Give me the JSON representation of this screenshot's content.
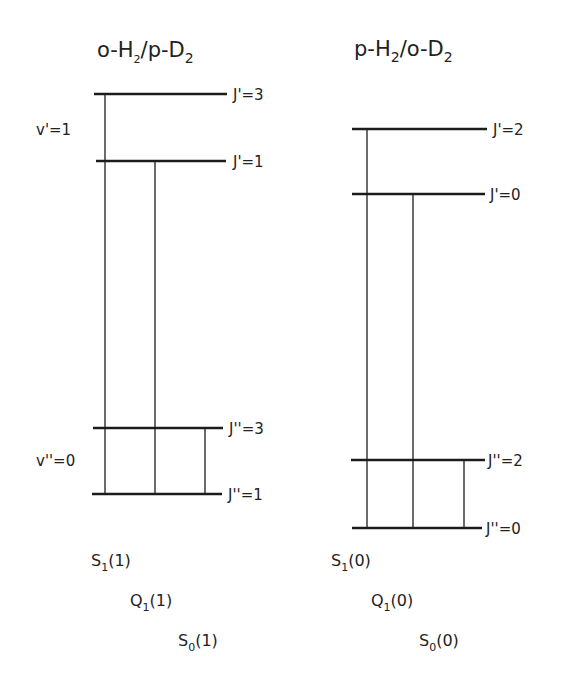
{
  "colors": {
    "ink": "#1c1c1c",
    "background": "#ffffff"
  },
  "left_panel": {
    "title_prefix": "o-H",
    "title_sub1": "2",
    "title_mid": "/p-D",
    "title_sub2": "2",
    "vib_upper": "v'=1",
    "vib_lower": "v''=0",
    "levels": [
      {
        "label": "J'=3",
        "y": 94
      },
      {
        "label": "J'=1",
        "y": 161
      },
      {
        "label": "J''=3",
        "y": 428
      },
      {
        "label": "J''=1",
        "y": 494
      }
    ],
    "transitions": [
      {
        "name": "S",
        "sub": "1",
        "arg": "(1)",
        "from": "J''=1",
        "to": "J'=3"
      },
      {
        "name": "Q",
        "sub": "1",
        "arg": "(1)",
        "from": "J''=1",
        "to": "J'=1"
      },
      {
        "name": "S",
        "sub": "0",
        "arg": "(1)",
        "from": "J''=1",
        "to": "J''=3"
      }
    ]
  },
  "right_panel": {
    "title_prefix": "p-H",
    "title_sub1": "2",
    "title_mid": "/o-D",
    "title_sub2": "2",
    "levels": [
      {
        "label": "J'=2",
        "y": 129
      },
      {
        "label": "J'=0",
        "y": 194
      },
      {
        "label": "J''=2",
        "y": 460
      },
      {
        "label": "J''=0",
        "y": 528
      }
    ],
    "transitions": [
      {
        "name": "S",
        "sub": "1",
        "arg": "(0)",
        "from": "J''=0",
        "to": "J'=2"
      },
      {
        "name": "Q",
        "sub": "1",
        "arg": "(0)",
        "from": "J''=0",
        "to": "J'=0"
      },
      {
        "name": "S",
        "sub": "0",
        "arg": "(0)",
        "from": "J''=0",
        "to": "J''=2"
      }
    ]
  }
}
